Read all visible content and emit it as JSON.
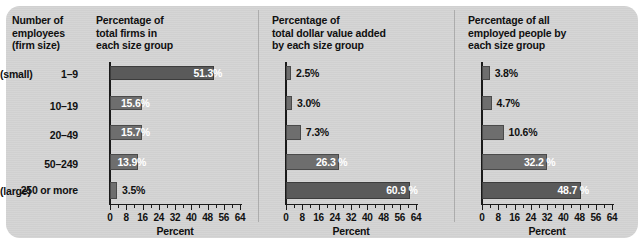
{
  "figure": {
    "background_color": "#d4d4d4",
    "bar_color": "#6e6e6e",
    "bar_color_dark": "#5a5a5a",
    "axis_color": "#1a1a1a"
  },
  "size_column": {
    "heading": "Number of\nemployees\n(firm size)",
    "small_label": "(small)",
    "large_label": "(large)",
    "rows": [
      {
        "range": "1–9"
      },
      {
        "range": "10–19"
      },
      {
        "range": "20–49"
      },
      {
        "range": "50–249"
      },
      {
        "range": "250 or\nmore"
      }
    ]
  },
  "axis": {
    "title": "Percent",
    "ticks": [
      "0",
      "8",
      "16",
      "24",
      "32",
      "40",
      "48",
      "56",
      "64"
    ],
    "min": 0,
    "max": 64,
    "minor_step": 4
  },
  "chart_data": [
    {
      "type": "bar",
      "orientation": "horizontal",
      "title": "Percentage of\ntotal firms in\neach size group",
      "categories": [
        "1–9",
        "10–19",
        "20–49",
        "50–249",
        "250 or more"
      ],
      "values": [
        51.3,
        15.6,
        15.7,
        13.9,
        3.5
      ],
      "labels": [
        "51.3%",
        "15.6%",
        "15.7%",
        "13.9%",
        "3.5%"
      ],
      "label_inside": [
        true,
        true,
        true,
        true,
        false
      ],
      "xlabel": "Percent",
      "ylabel": "",
      "xlim": [
        0,
        64
      ],
      "grid": false,
      "legend": "none"
    },
    {
      "type": "bar",
      "orientation": "horizontal",
      "title": "Percentage of\ntotal dollar value added\nby each size group",
      "categories": [
        "1–9",
        "10–19",
        "20–49",
        "50–249",
        "250 or more"
      ],
      "values": [
        2.5,
        3.0,
        7.3,
        26.3,
        60.9
      ],
      "labels": [
        "2.5%",
        "3.0%",
        "7.3%",
        "26.3 %",
        "60.9 %"
      ],
      "label_inside": [
        false,
        false,
        false,
        true,
        true
      ],
      "xlabel": "Percent",
      "ylabel": "",
      "xlim": [
        0,
        64
      ],
      "grid": false,
      "legend": "none"
    },
    {
      "type": "bar",
      "orientation": "horizontal",
      "title": "Percentage of all\nemployed people by\neach size group",
      "categories": [
        "1–9",
        "10–19",
        "20–49",
        "50–249",
        "250 or more"
      ],
      "values": [
        3.8,
        4.7,
        10.6,
        32.2,
        48.7
      ],
      "labels": [
        "3.8%",
        "4.7%",
        "10.6%",
        "32.2 %",
        "48.7 %"
      ],
      "label_inside": [
        false,
        false,
        false,
        true,
        true
      ],
      "xlabel": "Percent",
      "ylabel": "",
      "xlim": [
        0,
        64
      ],
      "grid": false,
      "legend": "none"
    }
  ]
}
